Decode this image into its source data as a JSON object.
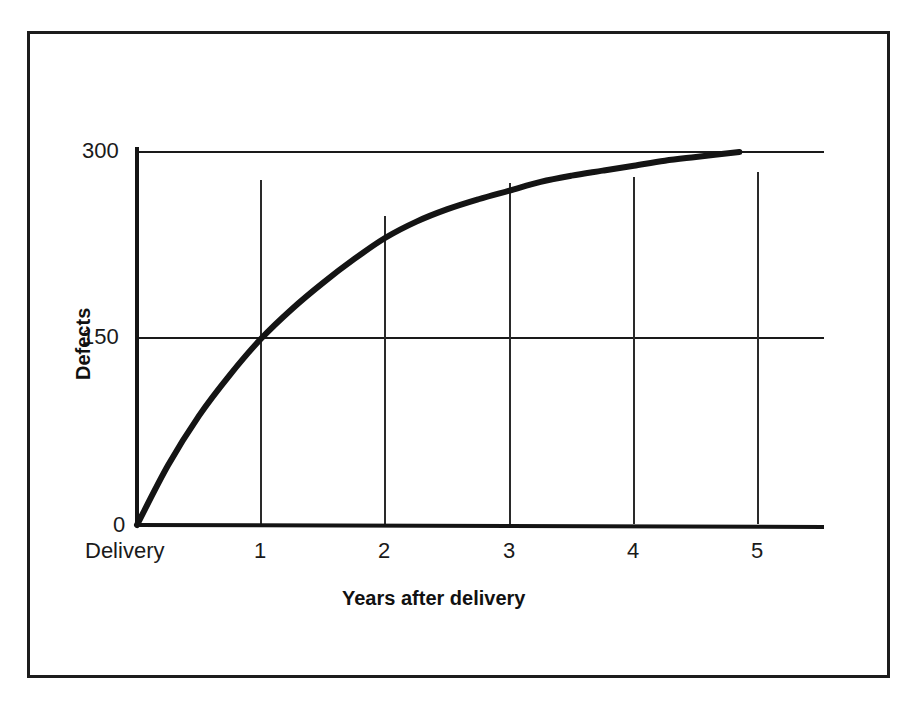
{
  "figure": {
    "border_color": "#1c1c1c",
    "background": "#ffffff",
    "line_color": "#141414"
  },
  "axes": {
    "y_title": "Defects",
    "x_title": "Years after delivery",
    "y_ticks": [
      {
        "label": "300",
        "value": 300
      },
      {
        "label": "150",
        "value": 150
      },
      {
        "label": "0",
        "value": 0
      }
    ],
    "x_ticks": [
      {
        "label": "Delivery",
        "value": 0
      },
      {
        "label": "1",
        "value": 1
      },
      {
        "label": "2",
        "value": 2
      },
      {
        "label": "3",
        "value": 3
      },
      {
        "label": "4",
        "value": 4
      },
      {
        "label": "5",
        "value": 5
      }
    ]
  },
  "chart_data": {
    "type": "line",
    "title": "",
    "xlabel": "Years after delivery",
    "ylabel": "Defects",
    "xlim": [
      0,
      5.5
    ],
    "ylim": [
      0,
      305
    ],
    "grid": true,
    "grid_lines": {
      "horizontal": [
        150,
        300
      ],
      "vertical": [
        1,
        2,
        3,
        4,
        5
      ]
    },
    "legend": null,
    "xticklabels": [
      "Delivery",
      "1",
      "2",
      "3",
      "4",
      "5"
    ],
    "yticklabels": [
      "0",
      "150",
      "300"
    ],
    "series": [
      {
        "name": "Cumulative defects",
        "x": [
          0,
          0.25,
          0.5,
          0.75,
          1,
          1.25,
          1.5,
          1.75,
          2,
          2.25,
          2.5,
          2.75,
          3,
          3.25,
          3.5,
          3.75,
          4,
          4.25,
          4.5,
          4.85
        ],
        "y": [
          0,
          48,
          88,
          121,
          150,
          174,
          195,
          214,
          231,
          244,
          254,
          262,
          269,
          276,
          281,
          285,
          289,
          293,
          296,
          300
        ]
      }
    ],
    "annotations": [
      "Curve rises steeply from 0 at delivery, passes 150 defects at year 1, and flattens to a plateau of 300 defects just before year 5."
    ]
  }
}
